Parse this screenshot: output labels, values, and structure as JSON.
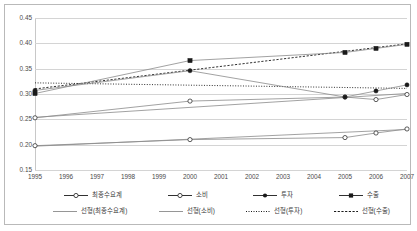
{
  "chart_data": {
    "type": "line",
    "title": "",
    "xlabel": "",
    "ylabel": "",
    "categories": [
      "1995",
      "1996",
      "1997",
      "1998",
      "1999",
      "2000",
      "2001",
      "2002",
      "2003",
      "2004",
      "2005",
      "2006",
      "2007"
    ],
    "x": [
      1995,
      1996,
      1997,
      1998,
      1999,
      2000,
      2001,
      2002,
      2003,
      2004,
      2005,
      2006,
      2007
    ],
    "ylim": [
      0.15,
      0.45
    ],
    "yticks": [
      "0.15",
      "0.20",
      "0.25",
      "0.30",
      "0.35",
      "0.40",
      "0.45"
    ],
    "ytick_values": [
      0.15,
      0.2,
      0.25,
      0.3,
      0.35,
      0.4,
      0.45
    ],
    "grid": true,
    "legend_position": "bottom",
    "series": [
      {
        "name": "최종수요계",
        "marker": "open-circle",
        "points": [
          {
            "x": 1995,
            "y": 0.253
          },
          {
            "x": 2000,
            "y": 0.286
          },
          {
            "x": 2005,
            "y": 0.294
          },
          {
            "x": 2006,
            "y": 0.289
          },
          {
            "x": 2007,
            "y": 0.299
          }
        ]
      },
      {
        "name": "소비",
        "marker": "open-circle",
        "points": [
          {
            "x": 1995,
            "y": 0.198
          },
          {
            "x": 2000,
            "y": 0.21
          },
          {
            "x": 2005,
            "y": 0.214
          },
          {
            "x": 2006,
            "y": 0.223
          },
          {
            "x": 2007,
            "y": 0.231
          }
        ]
      },
      {
        "name": "투자",
        "marker": "filled-circle",
        "points": [
          {
            "x": 1995,
            "y": 0.307
          },
          {
            "x": 2000,
            "y": 0.346
          },
          {
            "x": 2005,
            "y": 0.294
          },
          {
            "x": 2006,
            "y": 0.306
          },
          {
            "x": 2007,
            "y": 0.318
          }
        ]
      },
      {
        "name": "수출",
        "marker": "filled-square",
        "points": [
          {
            "x": 1995,
            "y": 0.301
          },
          {
            "x": 2000,
            "y": 0.366
          },
          {
            "x": 2005,
            "y": 0.382
          },
          {
            "x": 2006,
            "y": 0.39
          },
          {
            "x": 2007,
            "y": 0.398
          }
        ]
      }
    ],
    "trendlines": [
      {
        "name": "선형(최종수요계)",
        "style": "solid",
        "from": {
          "x": 1995,
          "y": 0.254
        },
        "to": {
          "x": 2007,
          "y": 0.301
        }
      },
      {
        "name": "선형(소비)",
        "style": "solid",
        "from": {
          "x": 1995,
          "y": 0.197
        },
        "to": {
          "x": 2007,
          "y": 0.23
        }
      },
      {
        "name": "선형(투자)",
        "style": "dotted",
        "from": {
          "x": 1995,
          "y": 0.322
        },
        "to": {
          "x": 2007,
          "y": 0.311
        }
      },
      {
        "name": "선형(수출)",
        "style": "dashed",
        "from": {
          "x": 1995,
          "y": 0.31
        },
        "to": {
          "x": 2007,
          "y": 0.399
        }
      }
    ]
  },
  "legend": {
    "row1": [
      {
        "label": "최종수요계",
        "key": "line-open-circle"
      },
      {
        "label": "소비",
        "key": "line-open-circle"
      },
      {
        "label": "투자",
        "key": "line-filled-circle"
      },
      {
        "label": "수출",
        "key": "line-filled-square"
      }
    ],
    "row2": [
      {
        "label": "선형(최종수요계)",
        "key": "line-solid"
      },
      {
        "label": "선형(소비)",
        "key": "line-solid"
      },
      {
        "label": "선형(투자)",
        "key": "line-dotted"
      },
      {
        "label": "선형(수출)",
        "key": "line-dashed"
      }
    ]
  },
  "colors": {
    "series_line": "#8a8a8a",
    "marker_dark": "#1a1a1a",
    "gridline": "#d4d4d4",
    "border": "#b9b9b9",
    "text": "#4a4a4a"
  }
}
